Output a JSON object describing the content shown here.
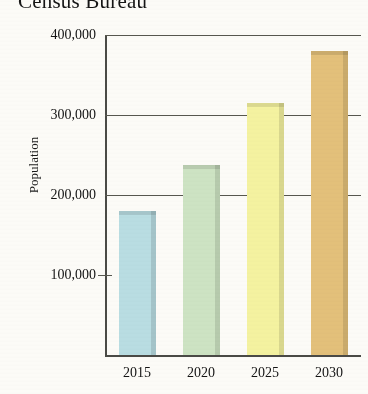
{
  "chart_data": {
    "type": "bar",
    "title": "Census Bureau",
    "xlabel": "",
    "ylabel": "Population",
    "categories": [
      "2015",
      "2020",
      "2025",
      "2030"
    ],
    "values": [
      180000,
      238000,
      315000,
      380000
    ],
    "ylim": [
      0,
      400000
    ],
    "yticks": [
      100000,
      200000,
      300000,
      400000
    ],
    "ytick_labels": [
      "100,000",
      "200,000",
      "300,000",
      "400,000"
    ],
    "grid": true,
    "grid_axis": "y",
    "legend": null,
    "bar_colors": [
      "#b9dde2",
      "#cde3c3",
      "#f4f2a0",
      "#e3c07a"
    ],
    "series": [
      {
        "name": "Population",
        "points": [
          {
            "category": "2015",
            "value": 180000,
            "color": "#b9dde2"
          },
          {
            "category": "2020",
            "value": 238000,
            "color": "#cde3c3"
          },
          {
            "category": "2025",
            "value": 315000,
            "color": "#f4f2a0"
          },
          {
            "category": "2030",
            "value": 380000,
            "color": "#e3c07a"
          }
        ]
      }
    ]
  },
  "axis": {
    "line_color": "#4a4a46",
    "grid_color": "#57574f"
  }
}
